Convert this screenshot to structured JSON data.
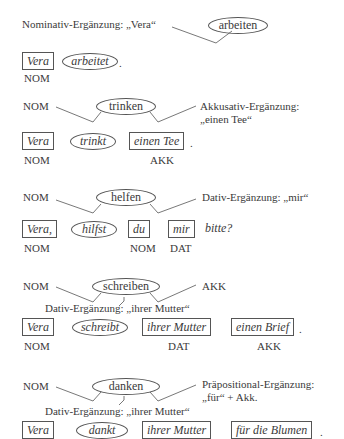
{
  "diagrams": [
    {
      "verb": "arbeiten",
      "left_label": "Nominativ-Ergänzung: „Vera“",
      "sentence": [
        "Vera",
        "arbeitet",
        "."
      ],
      "cases": [
        "NOM"
      ]
    },
    {
      "verb": "trinken",
      "left_label": "NOM",
      "right_label": [
        "Akkusativ-Ergänzung:",
        "„einen Tee“"
      ],
      "sentence": [
        "Vera",
        "trinkt",
        "einen Tee",
        "."
      ],
      "cases": [
        "NOM",
        "AKK"
      ]
    },
    {
      "verb": "helfen",
      "left_label": "NOM",
      "right_label": "Dativ-Ergänzung: „mir“",
      "sentence": [
        "Vera,",
        "hilfst",
        "du",
        "mir",
        "bitte?"
      ],
      "cases": [
        "NOM",
        "NOM",
        "DAT"
      ]
    },
    {
      "verb": "schreiben",
      "left_label": "NOM",
      "right_label": "AKK",
      "below_label": "Dativ-Ergänzung: „ihrer Mutter“",
      "sentence": [
        "Vera",
        "schreibt",
        "ihrer Mutter",
        "einen Brief",
        "."
      ],
      "cases": [
        "NOM",
        "DAT",
        "AKK"
      ]
    },
    {
      "verb": "danken",
      "left_label": "NOM",
      "right_label": [
        "Präpositional-Ergänzung:",
        "„für“ + Akk."
      ],
      "below_label": "Dativ-Ergänzung: „ihrer Mutter“",
      "sentence": [
        "Vera",
        "dankt",
        "ihrer Mutter",
        "für die Blumen",
        "."
      ]
    }
  ]
}
